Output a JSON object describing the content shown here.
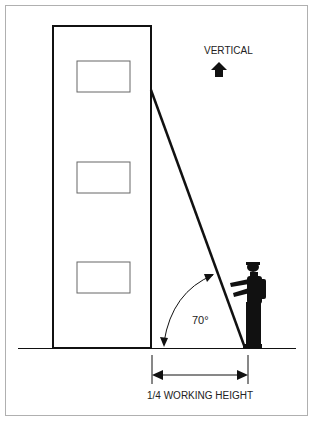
{
  "diagram": {
    "vertical_label": "VERTICAL",
    "angle_label": "70°",
    "base_label": "1/4 WORKING HEIGHT",
    "colors": {
      "line": "#111111",
      "frame": "#b0b0b0",
      "window": "#666666"
    }
  }
}
